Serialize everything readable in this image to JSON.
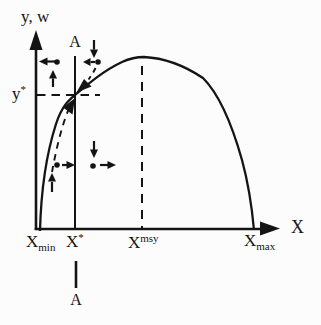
{
  "figure": {
    "ink_color": "#141414",
    "background_color": "#fcfcfc",
    "labels": {
      "y_axis_title": "y, w",
      "x_axis_title": "X",
      "section_line_top": "A",
      "section_line_bottom": "A",
      "y_star_base": "y",
      "y_star_sup": "*",
      "x_min_base": "X",
      "x_min_sub": "min",
      "x_star_base": "X",
      "x_star_sup": "*",
      "x_msy_base": "X",
      "x_msy_sup": "msy",
      "x_max_base": "X",
      "x_max_sub": "max"
    }
  }
}
